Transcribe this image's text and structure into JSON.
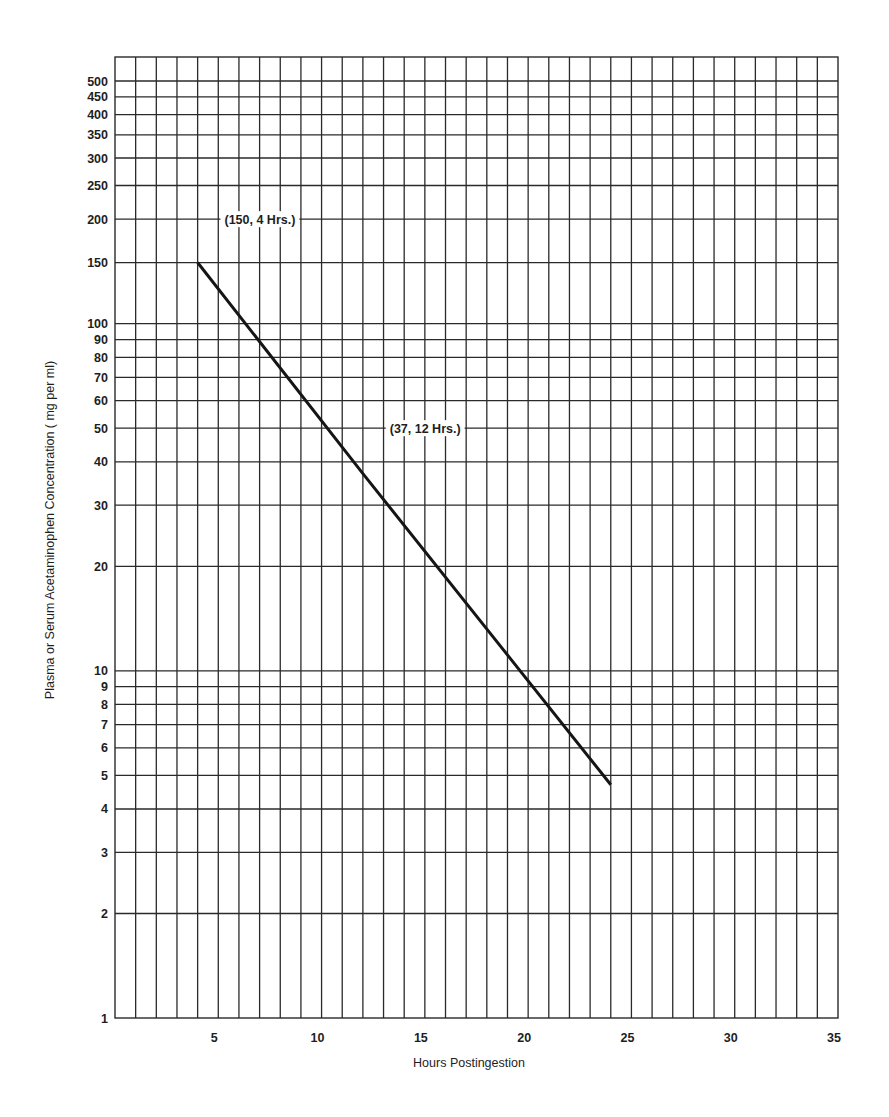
{
  "chart_data": {
    "type": "line",
    "title": "",
    "xlabel": "Hours Postingestion",
    "ylabel": "Plasma or Serum Acetaminophen Concentration ( mg per ml)",
    "xscale": "linear",
    "yscale": "log",
    "xlim": [
      0,
      35
    ],
    "ylim": [
      1,
      580
    ],
    "grid": true,
    "legend": null,
    "x_ticks": [
      5,
      10,
      15,
      20,
      25,
      30,
      35
    ],
    "x_tick_labels": [
      "5",
      "10",
      "15",
      "20",
      "25",
      "30",
      "35"
    ],
    "x_grid_step": 1,
    "y_ticks": [
      1,
      2,
      3,
      4,
      5,
      6,
      7,
      8,
      9,
      10,
      20,
      30,
      40,
      50,
      60,
      70,
      80,
      90,
      100,
      150,
      200,
      250,
      300,
      350,
      400,
      450,
      500
    ],
    "y_tick_labels": [
      "1",
      "2",
      "3",
      "4",
      "5",
      "6",
      "7",
      "8",
      "9",
      "10",
      "20",
      "30",
      "40",
      "50",
      "60",
      "70",
      "80",
      "90",
      "100",
      "150",
      "200",
      "250",
      "300",
      "350",
      "400",
      "450",
      "500"
    ],
    "series": [
      {
        "name": "Acetaminophen nomogram line",
        "x": [
          4,
          12,
          24
        ],
        "y": [
          150,
          37,
          4.7
        ],
        "color": "#151515"
      }
    ],
    "annotations": [
      {
        "text": "(150, 4 Hrs.)",
        "x": 5.3,
        "y": 200
      },
      {
        "text": "(37, 12 Hrs.)",
        "x": 13.3,
        "y": 50
      }
    ]
  }
}
